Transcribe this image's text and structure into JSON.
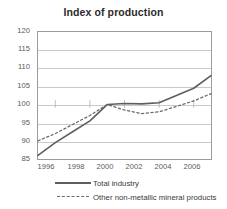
{
  "chart_data": {
    "type": "line",
    "title": "Index of production",
    "xlabel": "",
    "ylabel": "",
    "ylim": [
      85,
      120
    ],
    "xlim": [
      1996,
      2006
    ],
    "yticks": [
      120,
      115,
      110,
      105,
      100,
      95,
      90,
      85
    ],
    "xticks": [
      1996,
      1998,
      2000,
      2002,
      2004,
      2006
    ],
    "grid": true,
    "legend_position": "bottom",
    "x": [
      1996,
      1997,
      1998,
      1999,
      2000,
      2001,
      2002,
      2003,
      2004,
      2005,
      2006
    ],
    "series": [
      {
        "name": "Total industry",
        "style": "solid",
        "color": "#5e5e5e",
        "values": [
          86.0,
          89.5,
          92.5,
          95.5,
          100.0,
          100.3,
          100.2,
          100.5,
          102.5,
          104.5,
          108.0
        ]
      },
      {
        "name": "Other non-metallic mineral products",
        "style": "dashed",
        "color": "#6a6a6a",
        "values": [
          90.0,
          92.0,
          94.5,
          97.0,
          100.0,
          98.5,
          97.5,
          98.0,
          99.5,
          101.0,
          103.0
        ]
      }
    ]
  },
  "legend": {
    "items": [
      {
        "label": "Total industry",
        "style": "solid"
      },
      {
        "label": "Other non-metallic mineral products",
        "style": "dashed"
      }
    ]
  },
  "axis": {
    "y_labels": [
      "120",
      "115",
      "110",
      "105",
      "100",
      "95",
      "90",
      "85"
    ],
    "x_labels": [
      "1996",
      "1998",
      "2000",
      "2002",
      "2004",
      "2006"
    ]
  }
}
